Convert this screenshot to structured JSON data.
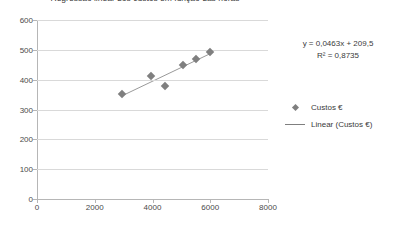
{
  "chart_data": {
    "type": "scatter",
    "title": "Regressão linear dos custos em função das horas",
    "xlabel": "",
    "ylabel": "",
    "xlim": [
      0,
      8000
    ],
    "ylim": [
      0,
      600
    ],
    "xticks": [
      0,
      2000,
      4000,
      6000,
      8000
    ],
    "yticks": [
      0,
      100,
      200,
      300,
      400,
      500,
      600
    ],
    "xtick_labels": [
      "0",
      "2000",
      "4000",
      "6000",
      "8000"
    ],
    "ytick_labels": [
      "0",
      "100",
      "200",
      "300",
      "400",
      "500",
      "600"
    ],
    "grid": "horizontal",
    "legend_position": "right",
    "series": [
      {
        "name": "Custos €",
        "type": "scatter",
        "marker": "diamond",
        "color": "#7f7f7f",
        "points": [
          {
            "x": 2950,
            "y": 352
          },
          {
            "x": 3950,
            "y": 412
          },
          {
            "x": 4450,
            "y": 380
          },
          {
            "x": 5050,
            "y": 450
          },
          {
            "x": 5500,
            "y": 470
          },
          {
            "x": 5980,
            "y": 492
          }
        ]
      },
      {
        "name": "Linear (Custos €)",
        "type": "line",
        "color": "#7f7f7f",
        "fit": "linear",
        "slope": 0.0463,
        "intercept": 209.5,
        "r_squared": 0.8735,
        "x_start": 2950,
        "x_end": 5980
      }
    ],
    "annotations": [
      {
        "text": "y = 0,0463x + 209,5"
      },
      {
        "text": "R² = 0,8735"
      }
    ]
  },
  "equation": {
    "line1": "y = 0,0463x + 209,5",
    "line2": "R² = 0,8735"
  },
  "legend": {
    "items": [
      {
        "label": "Custos €",
        "marker": "diamond-marker"
      },
      {
        "label": "Linear (Custos €)",
        "marker": "line-marker"
      }
    ]
  },
  "colors": {
    "series": "#7f7f7f",
    "gridline": "#d9d9d9",
    "axis": "#b6b6b6",
    "text": "#3a3a3a"
  }
}
